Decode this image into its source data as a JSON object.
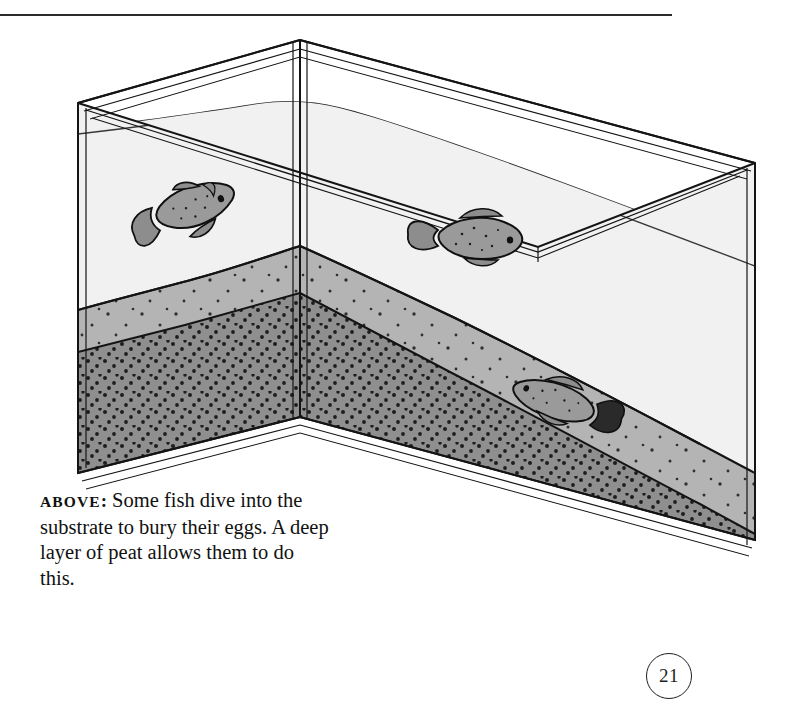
{
  "page": {
    "number": "21",
    "rule_color": "#2b2b2b"
  },
  "caption": {
    "lead": "ABOVE",
    "colon": ":",
    "text": " Some fish dive into the substrate to bury their eggs. A deep layer of peat allows them to do this."
  },
  "illustration": {
    "title": "aquarium-cutaway-diagram",
    "subject": "Aquarium tank shown in isometric view with a deep peat substrate layer and three killifish",
    "colors": {
      "outline": "#141414",
      "glass_fill": "#ffffff",
      "water": "#f0f0f0",
      "water_side": "#efefef",
      "sand_top": "#b4b4b4",
      "sand_front": "#ababab",
      "peat_front": "#8f8f8f",
      "peat_side": "#8a8a8a",
      "fish_body": "#9a9a9a",
      "fish_outline": "#101010",
      "dot": "#121212"
    },
    "layers": [
      {
        "name": "water",
        "label": "water"
      },
      {
        "name": "sand-substrate",
        "label": "substrate"
      },
      {
        "name": "peat-layer",
        "label": "deep layer of peat"
      }
    ],
    "fish": [
      {
        "name": "diving-fish",
        "pose": "head-down diving into substrate"
      },
      {
        "name": "swimming-fish-right",
        "pose": "swimming horizontally facing right"
      },
      {
        "name": "swimming-fish-left",
        "pose": "swimming near substrate facing left"
      }
    ]
  }
}
